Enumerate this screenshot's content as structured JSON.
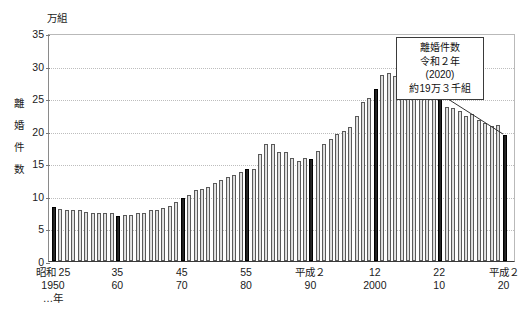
{
  "top_strip": {
    "clipped_text": "————  —————  ————  ——  —————  —"
  },
  "unit_label": "万組",
  "y_axis_title_chars": [
    "離",
    "婚",
    "件",
    "数"
  ],
  "annotation": {
    "line1": "離婚件数",
    "line2": "令和２年",
    "line3": "(2020)",
    "line4": "約19万３千組"
  },
  "x_axis_labels": [
    {
      "year": 1950,
      "l1": "昭和 25",
      "l2": "1950",
      "l3": "…年"
    },
    {
      "year": 1960,
      "l1": "35",
      "l2": "60",
      "l3": ""
    },
    {
      "year": 1970,
      "l1": "45",
      "l2": "70",
      "l3": ""
    },
    {
      "year": 1980,
      "l1": "55",
      "l2": "80",
      "l3": ""
    },
    {
      "year": 1990,
      "l1": "平成２",
      "l2": "90",
      "l3": ""
    },
    {
      "year": 2000,
      "l1": "12",
      "l2": "2000",
      "l3": ""
    },
    {
      "year": 2010,
      "l1": "22",
      "l2": "10",
      "l3": ""
    },
    {
      "year": 2020,
      "l1": "平成２",
      "l2": "20",
      "l3": ""
    }
  ],
  "colors": {
    "bar_normal": "#d8d8d8",
    "bar_highlight": "#1a1a1a",
    "grid": "#bdbdbd",
    "axis": "#3a3a3a",
    "text": "#1a1a1a"
  },
  "chart_data": {
    "type": "bar",
    "xlabel": "年",
    "ylabel": "離婚件数",
    "unit": "万組",
    "ylim": [
      0,
      35
    ],
    "yticks": [
      0,
      5,
      10,
      15,
      20,
      25,
      30,
      35
    ],
    "grid": true,
    "legend": null,
    "highlight_years": [
      1950,
      1960,
      1970,
      1980,
      1990,
      2000,
      2010,
      2020
    ],
    "x": [
      1950,
      1951,
      1952,
      1953,
      1954,
      1955,
      1956,
      1957,
      1958,
      1959,
      1960,
      1961,
      1962,
      1963,
      1964,
      1965,
      1966,
      1967,
      1968,
      1969,
      1970,
      1971,
      1972,
      1973,
      1974,
      1975,
      1976,
      1977,
      1978,
      1979,
      1980,
      1981,
      1982,
      1983,
      1984,
      1985,
      1986,
      1987,
      1988,
      1989,
      1990,
      1991,
      1992,
      1993,
      1994,
      1995,
      1996,
      1997,
      1998,
      1999,
      2000,
      2001,
      2002,
      2003,
      2004,
      2005,
      2006,
      2007,
      2008,
      2009,
      2010,
      2011,
      2012,
      2013,
      2014,
      2015,
      2016,
      2017,
      2018,
      2019,
      2020
    ],
    "values": [
      8.3,
      8.0,
      7.9,
      7.8,
      7.8,
      7.6,
      7.4,
      7.4,
      7.4,
      7.3,
      6.9,
      7.0,
      7.1,
      7.3,
      7.4,
      7.8,
      7.9,
      8.2,
      8.5,
      9.0,
      9.6,
      10.1,
      10.9,
      11.1,
      11.4,
      11.9,
      12.4,
      12.9,
      13.2,
      13.6,
      14.2,
      14.2,
      16.4,
      17.9,
      17.9,
      16.7,
      16.7,
      15.8,
      15.4,
      15.8,
      15.7,
      16.9,
      17.9,
      18.8,
      19.5,
      19.9,
      20.6,
      22.2,
      24.4,
      25.0,
      26.4,
      28.5,
      28.9,
      28.4,
      27.0,
      26.2,
      25.7,
      25.5,
      25.1,
      25.3,
      25.1,
      23.6,
      23.5,
      23.1,
      22.2,
      22.6,
      21.7,
      21.2,
      20.8,
      20.9,
      19.3
    ]
  }
}
